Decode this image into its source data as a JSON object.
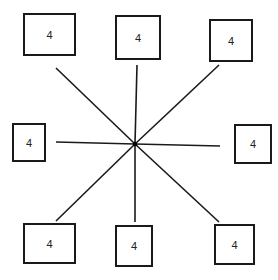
{
  "diagram": {
    "type": "star",
    "center": {
      "x": 135,
      "y": 144
    },
    "line_color": "#1a1a1a",
    "nodes": [
      {
        "id": "top-left",
        "label": "4",
        "x": 23,
        "y": 13,
        "w": 53,
        "h": 43,
        "line_end": {
          "x": 56,
          "y": 68
        }
      },
      {
        "id": "top",
        "label": "4",
        "x": 115,
        "y": 15,
        "w": 46,
        "h": 45,
        "line_end": {
          "x": 137,
          "y": 65
        }
      },
      {
        "id": "top-right",
        "label": "4",
        "x": 209,
        "y": 19,
        "w": 44,
        "h": 43,
        "line_end": {
          "x": 219,
          "y": 65
        }
      },
      {
        "id": "left",
        "label": "4",
        "x": 12,
        "y": 123,
        "w": 34,
        "h": 39,
        "line_end": {
          "x": 56,
          "y": 142
        }
      },
      {
        "id": "right",
        "label": "4",
        "x": 234,
        "y": 124,
        "w": 38,
        "h": 40,
        "line_end": {
          "x": 220,
          "y": 146
        }
      },
      {
        "id": "bottom-left",
        "label": "4",
        "x": 23,
        "y": 223,
        "w": 53,
        "h": 41,
        "line_end": {
          "x": 56,
          "y": 221
        }
      },
      {
        "id": "bottom",
        "label": "4",
        "x": 115,
        "y": 225,
        "w": 38,
        "h": 42,
        "line_end": {
          "x": 135,
          "y": 222
        }
      },
      {
        "id": "bottom-right",
        "label": "4",
        "x": 214,
        "y": 224,
        "w": 41,
        "h": 41,
        "line_end": {
          "x": 219,
          "y": 222
        }
      }
    ]
  }
}
